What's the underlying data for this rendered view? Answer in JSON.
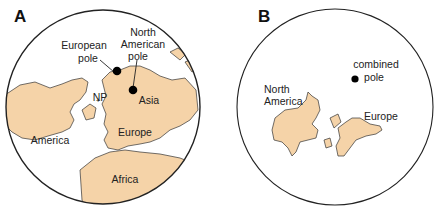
{
  "colors": {
    "land": "#f5d3a8",
    "outline": "#222222",
    "pole": "#000000"
  },
  "panel_a": {
    "label": "A",
    "european_pole": [
      "European",
      "pole"
    ],
    "north_american_pole": [
      "North",
      "American",
      "pole"
    ],
    "np": "NP",
    "asia": "Asia",
    "europe": "Europe",
    "america": "America",
    "africa": "Africa"
  },
  "panel_b": {
    "label": "B",
    "combined_pole": [
      "combined",
      "pole"
    ],
    "north_america": [
      "North",
      "America"
    ],
    "europe": "Europe"
  }
}
